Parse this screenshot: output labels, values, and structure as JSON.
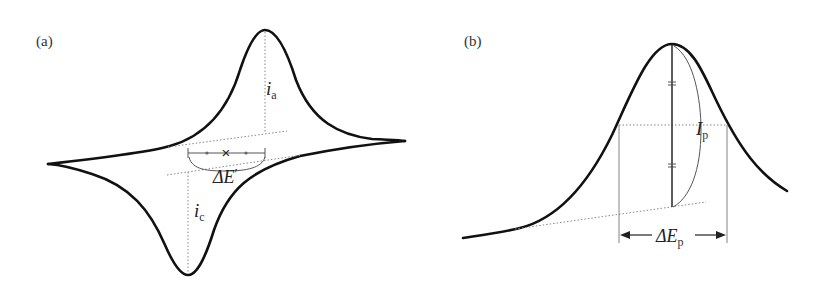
{
  "figure": {
    "panel_a": {
      "label": "(a)",
      "anodic_current": {
        "symbol": "i",
        "subscript": "a"
      },
      "cathodic_current": {
        "symbol": "i",
        "subscript": "c"
      },
      "peak_separation": {
        "symbol": "ΔE",
        "prime": "′"
      },
      "midpoint_marker": "×"
    },
    "panel_b": {
      "label": "(b)",
      "peak_current": {
        "symbol": "I",
        "subscript": "p"
      },
      "peak_width": {
        "symbol": "ΔE",
        "subscript": "p"
      }
    },
    "colors": {
      "curve": "#111111",
      "guides": "#888888",
      "background": "#ffffff"
    }
  }
}
